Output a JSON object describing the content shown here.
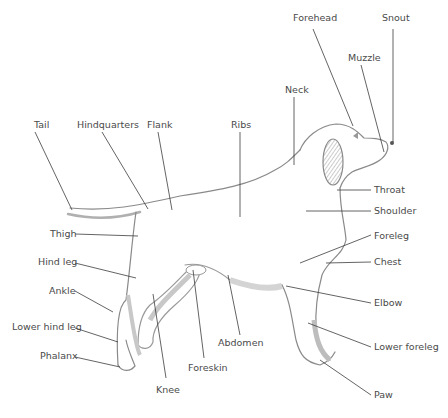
{
  "diagram": {
    "labels": [
      {
        "id": "forehead",
        "text": "Forehead",
        "x": 293,
        "y": 18
      },
      {
        "id": "snout",
        "text": "Snout",
        "x": 382,
        "y": 18
      },
      {
        "id": "muzzle",
        "text": "Muzzle",
        "x": 348,
        "y": 52
      },
      {
        "id": "neck",
        "text": "Neck",
        "x": 285,
        "y": 84
      },
      {
        "id": "tail",
        "text": "Tail",
        "x": 34,
        "y": 120
      },
      {
        "id": "hindquarters",
        "text": "Hindquarters",
        "x": 77,
        "y": 120
      },
      {
        "id": "flank",
        "text": "Flank",
        "x": 147,
        "y": 120
      },
      {
        "id": "ribs",
        "text": "Ribs",
        "x": 231,
        "y": 120
      },
      {
        "id": "throat",
        "text": "Throat",
        "x": 374,
        "y": 186
      },
      {
        "id": "shoulder",
        "text": "Shoulder",
        "x": 373,
        "y": 206
      },
      {
        "id": "thigh",
        "text": "Thigh",
        "x": 50,
        "y": 230
      },
      {
        "id": "foreleg",
        "text": "Foreleg",
        "x": 373,
        "y": 231
      },
      {
        "id": "chest",
        "text": "Chest",
        "x": 373,
        "y": 257
      },
      {
        "id": "hind_leg",
        "text": "Hind leg",
        "x": 38,
        "y": 258
      },
      {
        "id": "ankle",
        "text": "Ankle",
        "x": 49,
        "y": 287
      },
      {
        "id": "elbow",
        "text": "Elbow",
        "x": 373,
        "y": 299
      },
      {
        "id": "abdomen",
        "text": "Abdomen",
        "x": 218,
        "y": 339
      },
      {
        "id": "lower_hind_leg",
        "text": "Lower hind leg",
        "x": 12,
        "y": 322
      },
      {
        "id": "lower_foreleg",
        "text": "Lower foreleg",
        "x": 374,
        "y": 343
      },
      {
        "id": "phalanx",
        "text": "Phalanx",
        "x": 40,
        "y": 352
      },
      {
        "id": "foreskin",
        "text": "Foreskin",
        "x": 188,
        "y": 363
      },
      {
        "id": "knee",
        "text": "Knee",
        "x": 156,
        "y": 385
      },
      {
        "id": "paw",
        "text": "Paw",
        "x": 374,
        "y": 391
      }
    ]
  }
}
